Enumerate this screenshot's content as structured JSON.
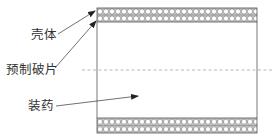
{
  "diagram": {
    "title": "",
    "labels": {
      "shell": "壳体",
      "fragments": "预制破片",
      "charge": "装药"
    },
    "colors": {
      "line": "#555555",
      "band_bg": "#bdbdbd",
      "circle": "#ffffff",
      "text": "#333333"
    }
  }
}
